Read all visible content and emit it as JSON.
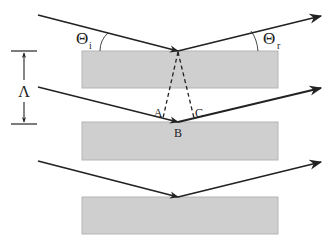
{
  "diagram": {
    "title": "",
    "colors": {
      "background": "#ffffff",
      "layer_fill": "#cfcfcf",
      "layer_stroke": "#b8b8b8",
      "ray": "#222222"
    },
    "layers": [
      {
        "id": "layer-1",
        "x": 82,
        "y": 51,
        "w": 196,
        "h": 37
      },
      {
        "id": "layer-2",
        "x": 82,
        "y": 122,
        "w": 196,
        "h": 38
      },
      {
        "id": "layer-3",
        "x": 82,
        "y": 197,
        "w": 196,
        "h": 37
      }
    ],
    "labels": {
      "theta_incident": "Θ",
      "theta_incident_sub": "i",
      "theta_reflected": "Θ",
      "theta_reflected_sub": "r",
      "period": "Λ",
      "point_a": "A",
      "point_b": "B",
      "point_c": "C"
    }
  }
}
